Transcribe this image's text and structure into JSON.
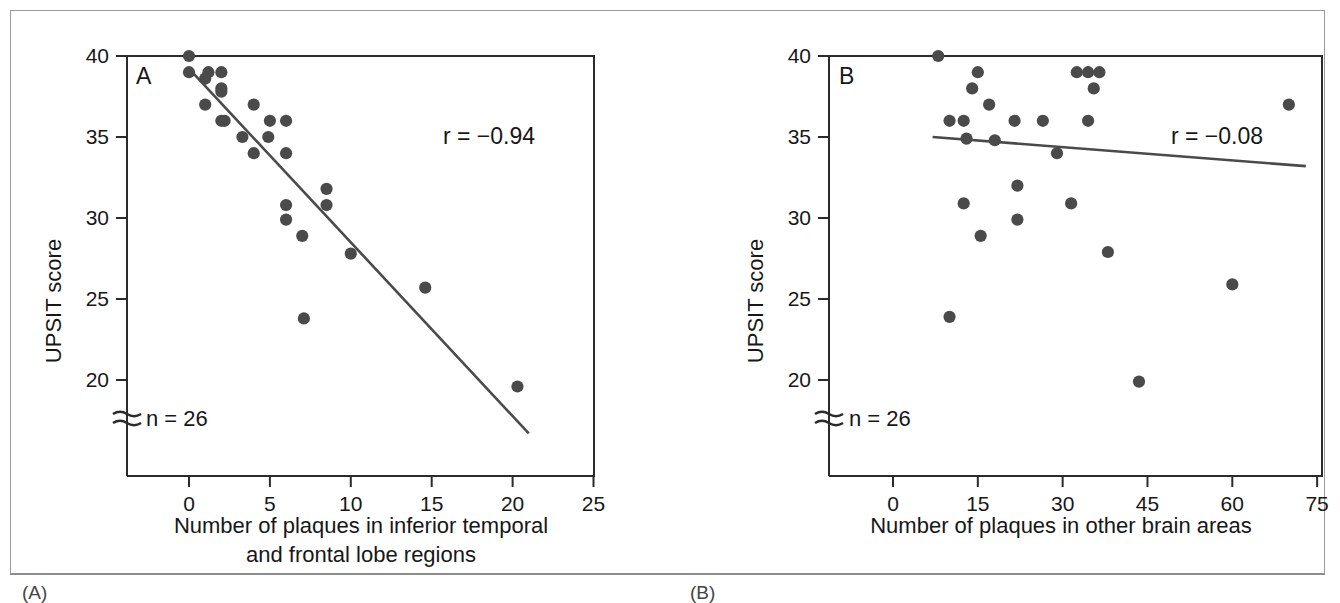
{
  "figure": {
    "panels": [
      {
        "id": "A",
        "letter": "A",
        "caption_label": "(A)",
        "r_label": "r = −0.94",
        "n_label": "n = 26",
        "axis_break_glyph": "≈",
        "ylabel": "UPSIT score",
        "xlabel": "Number of plaques in inferior temporal\nand frontal lobe regions",
        "yticks": [
          "40",
          "35",
          "30",
          "25",
          "20"
        ],
        "xticks": [
          "0",
          "5",
          "10",
          "15",
          "20",
          "25"
        ]
      },
      {
        "id": "B",
        "letter": "B",
        "caption_label": "(B)",
        "r_label": "r = −0.08",
        "n_label": "n = 26",
        "axis_break_glyph": "≈",
        "ylabel": "UPSIT score",
        "xlabel": "Number of plaques in other brain areas",
        "yticks": [
          "40",
          "35",
          "30",
          "25",
          "20"
        ],
        "xticks": [
          "0",
          "15",
          "30",
          "45",
          "60",
          "75"
        ]
      }
    ],
    "colors": {
      "marker": "#4a4a4a",
      "line": "#4a4a4a",
      "axis": "#2b2b2b",
      "frame": "#9a9a9a",
      "text": "#171717",
      "background": "#ffffff"
    }
  },
  "chart_data": [
    {
      "type": "scatter",
      "panel": "A",
      "title": "",
      "xlabel": "Number of plaques in inferior temporal and frontal lobe regions",
      "ylabel": "UPSIT score",
      "xlim": [
        -3.8,
        25
      ],
      "ylim": [
        14.0,
        40
      ],
      "yaxis_broken": true,
      "xticks": [
        0,
        5,
        10,
        15,
        20,
        25
      ],
      "yticks": [
        20,
        25,
        30,
        35,
        40
      ],
      "grid": false,
      "legend": null,
      "annotations": [
        {
          "text": "A",
          "role": "panel-letter"
        },
        {
          "text": "r = −0.94",
          "role": "correlation"
        },
        {
          "text": "n = 26",
          "role": "sample-size"
        }
      ],
      "correlation_r": -0.94,
      "n": 26,
      "points": [
        {
          "x": 0.0,
          "y": 40.0
        },
        {
          "x": 0.0,
          "y": 39.0
        },
        {
          "x": 1.0,
          "y": 38.6
        },
        {
          "x": 1.2,
          "y": 39.0
        },
        {
          "x": 2.0,
          "y": 39.0
        },
        {
          "x": 1.0,
          "y": 37.0
        },
        {
          "x": 2.0,
          "y": 38.0
        },
        {
          "x": 2.0,
          "y": 37.8
        },
        {
          "x": 2.0,
          "y": 36.0
        },
        {
          "x": 2.2,
          "y": 36.0
        },
        {
          "x": 4.0,
          "y": 37.0
        },
        {
          "x": 3.3,
          "y": 35.0
        },
        {
          "x": 5.0,
          "y": 36.0
        },
        {
          "x": 6.0,
          "y": 36.0
        },
        {
          "x": 4.9,
          "y": 35.0
        },
        {
          "x": 4.0,
          "y": 34.0
        },
        {
          "x": 6.0,
          "y": 34.0
        },
        {
          "x": 8.5,
          "y": 31.8
        },
        {
          "x": 6.0,
          "y": 30.8
        },
        {
          "x": 8.5,
          "y": 30.8
        },
        {
          "x": 6.0,
          "y": 29.9
        },
        {
          "x": 7.0,
          "y": 28.9
        },
        {
          "x": 10.0,
          "y": 27.8
        },
        {
          "x": 14.6,
          "y": 25.7
        },
        {
          "x": 7.1,
          "y": 23.8
        },
        {
          "x": 20.3,
          "y": 19.6
        }
      ],
      "fit_line": {
        "x0": 0.3,
        "y0": 38.9,
        "x1": 21.0,
        "y1": 16.7
      }
    },
    {
      "type": "scatter",
      "panel": "B",
      "title": "",
      "xlabel": "Number of plaques in other brain areas",
      "ylabel": "UPSIT score",
      "xlim": [
        -11,
        75
      ],
      "ylim": [
        14.0,
        40
      ],
      "yaxis_broken": true,
      "xticks": [
        0,
        15,
        30,
        45,
        60,
        75
      ],
      "yticks": [
        20,
        25,
        30,
        35,
        40
      ],
      "grid": false,
      "legend": null,
      "annotations": [
        {
          "text": "B",
          "role": "panel-letter"
        },
        {
          "text": "r = −0.08",
          "role": "correlation"
        },
        {
          "text": "n = 26",
          "role": "sample-size"
        }
      ],
      "correlation_r": -0.08,
      "n": 26,
      "points": [
        {
          "x": 8.0,
          "y": 40.0
        },
        {
          "x": 15.0,
          "y": 39.0
        },
        {
          "x": 32.5,
          "y": 39.0
        },
        {
          "x": 34.5,
          "y": 39.0
        },
        {
          "x": 36.5,
          "y": 39.0
        },
        {
          "x": 14.0,
          "y": 38.0
        },
        {
          "x": 35.5,
          "y": 38.0
        },
        {
          "x": 17.0,
          "y": 37.0
        },
        {
          "x": 70.0,
          "y": 37.0
        },
        {
          "x": 10.0,
          "y": 36.0
        },
        {
          "x": 12.5,
          "y": 36.0
        },
        {
          "x": 21.5,
          "y": 36.0
        },
        {
          "x": 26.5,
          "y": 36.0
        },
        {
          "x": 34.5,
          "y": 36.0
        },
        {
          "x": 13.0,
          "y": 34.9
        },
        {
          "x": 18.0,
          "y": 34.8
        },
        {
          "x": 29.0,
          "y": 34.0
        },
        {
          "x": 22.0,
          "y": 32.0
        },
        {
          "x": 12.5,
          "y": 30.9
        },
        {
          "x": 31.5,
          "y": 30.9
        },
        {
          "x": 22.0,
          "y": 29.9
        },
        {
          "x": 15.5,
          "y": 28.9
        },
        {
          "x": 38.0,
          "y": 27.9
        },
        {
          "x": 60.0,
          "y": 25.9
        },
        {
          "x": 10.0,
          "y": 23.9
        },
        {
          "x": 43.5,
          "y": 19.9
        }
      ],
      "fit_line": {
        "x0": 7.0,
        "y0": 35.0,
        "x1": 73.0,
        "y1": 33.2
      }
    }
  ]
}
